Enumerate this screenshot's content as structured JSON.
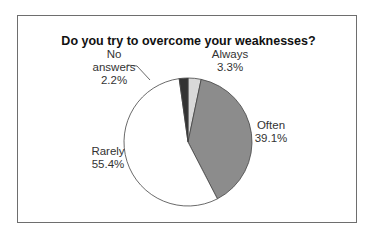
{
  "chart_data": {
    "type": "pie",
    "title": "Do you try to overcome your weaknesses?",
    "categories": [
      "Always",
      "Often",
      "Rarely",
      "No answers"
    ],
    "values": [
      3.3,
      39.1,
      55.4,
      2.2
    ],
    "labels": [
      {
        "name": "Always",
        "value": "3.3%"
      },
      {
        "name": "Often",
        "value": "39.1%"
      },
      {
        "name": "Rarely",
        "value": "55.4%"
      },
      {
        "name": "No answers",
        "name_line1": "No",
        "name_line2": "answers",
        "value": "2.2%"
      }
    ],
    "colors": [
      "#d9d9d9",
      "#8c8c8c",
      "#ffffff",
      "#333333"
    ],
    "start_angle": "12 o'clock, clockwise",
    "legend": "none (data labels)"
  }
}
